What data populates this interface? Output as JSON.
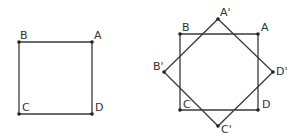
{
  "figures": [
    {
      "name": "original-square",
      "points": {
        "A": {
          "label": "A",
          "x": 92,
          "y": 42
        },
        "B": {
          "label": "B",
          "x": 19,
          "y": 42
        },
        "C": {
          "label": "C",
          "x": 19,
          "y": 114
        },
        "D": {
          "label": "D",
          "x": 92,
          "y": 114
        }
      }
    },
    {
      "name": "square-and-rotated-square",
      "points": {
        "A": {
          "label": "A",
          "x": 258,
          "y": 34
        },
        "B": {
          "label": "B",
          "x": 180,
          "y": 34
        },
        "C": {
          "label": "C",
          "x": 180,
          "y": 110
        },
        "D": {
          "label": "D",
          "x": 258,
          "y": 110
        },
        "A'": {
          "label": "A'",
          "x": 218,
          "y": 19
        },
        "B'": {
          "label": "B'",
          "x": 164,
          "y": 72
        },
        "C'": {
          "label": "C'",
          "x": 218,
          "y": 126
        },
        "D'": {
          "label": "D'",
          "x": 273,
          "y": 72
        }
      }
    }
  ],
  "labels": {
    "left": {
      "A": "A",
      "B": "B",
      "C": "C",
      "D": "D"
    },
    "right": {
      "A": "A",
      "B": "B",
      "C": "C",
      "D": "D",
      "A1": "A'",
      "B1": "B'",
      "C1": "C'",
      "D1": "D'"
    }
  },
  "colors": {
    "stroke": "#3a3a3a",
    "point": "#222222",
    "text": "#333333"
  }
}
